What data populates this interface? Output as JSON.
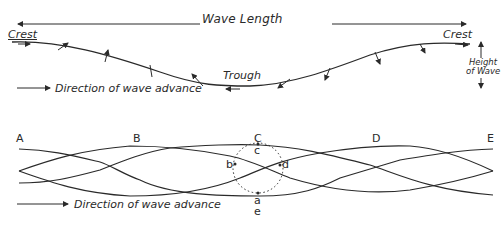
{
  "top_diagram": {
    "wave_length_label": "Wave Length",
    "crest_left_label": "Crest",
    "crest_right_label": "Crest",
    "trough_label": "Trough",
    "height_label_line1": "Height",
    "height_label_line2": "of Wave",
    "direction_label": "Direction of wave advance"
  },
  "bottom_diagram": {
    "points_upper": [
      "A",
      "B",
      "C",
      "D",
      "E"
    ],
    "orbit_points": {
      "b": "b",
      "c": "c",
      "d": "d",
      "a": "a",
      "e": "e"
    },
    "direction_label": "Direction of wave advance"
  },
  "colors": {
    "ink": "#2a2a2a",
    "background": "#ffffff"
  }
}
